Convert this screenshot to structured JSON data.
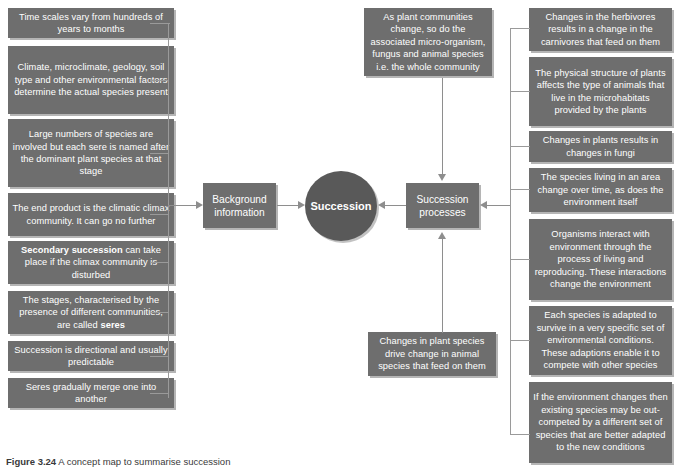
{
  "figure": {
    "caption_number": "Figure 3.24",
    "caption_text": "A concept map to summarise succession"
  },
  "core": {
    "label": "Succession"
  },
  "hubs": {
    "background": "Background\ninformation",
    "background_label": "Background information",
    "processes": "Succession\nprocesses",
    "processes_label": "Succession processes"
  },
  "left_branch": {
    "title": "Background information",
    "items": [
      {
        "id": "time-scales",
        "text": "Time scales vary from hundreds of years to months"
      },
      {
        "id": "climate-factors",
        "text": "Climate, microclimate, geology, soil type and other environmental factors determine the actual species present"
      },
      {
        "id": "large-numbers",
        "text": "Large numbers of species are involved but each sere is named after the dominant plant species at that stage"
      },
      {
        "id": "end-product",
        "text": "The end product is the climatic climax community. It can go no further"
      },
      {
        "id": "secondary-succession",
        "text": "Secondary succession can take place if the climax community is disturbed",
        "bold_prefix": "Secondary succession"
      },
      {
        "id": "stages-seres",
        "text": "The stages, characterised by the presence of different communities, are called seres",
        "bold_suffix": "seres"
      },
      {
        "id": "directional",
        "text": "Succession is directional and usually predictable"
      },
      {
        "id": "seres-merge",
        "text": "Seres gradually merge one into another"
      }
    ]
  },
  "top_branch": {
    "items": [
      {
        "id": "whole-community",
        "text": "As plant communities change, so do the associated micro-organism, fungus and animal species i.e. the whole community"
      }
    ]
  },
  "bottom_branch": {
    "items": [
      {
        "id": "plant-to-animal",
        "text": "Changes in plant species drive change in animal species that feed on them"
      }
    ]
  },
  "right_branch": {
    "title": "Succession processes",
    "items": [
      {
        "id": "herbivores-carnivores",
        "text": "Changes in the herbivores results in a change in the carnivores that feed on them"
      },
      {
        "id": "physical-structure",
        "text": "The physical structure of plants affects the type of animals that live in the microhabitats provided by the plants"
      },
      {
        "id": "plants-fungi",
        "text": "Changes in plants results in changes in fungi"
      },
      {
        "id": "species-change-time",
        "text": "The species living in an area change over time, as does the environment itself"
      },
      {
        "id": "organisms-interact",
        "text": "Organisms interact with environment through the process of living and reproducing. These interactions change the environment"
      },
      {
        "id": "adapted-species",
        "text": "Each species is adapted to survive in a very specific set of environmental conditions. These adaptions enable it to compete with other species"
      },
      {
        "id": "out-competed",
        "text": "If the environment changes then existing species may be out-competed by a different set of species that are better adapted to the new conditions"
      }
    ]
  },
  "colors": {
    "node_fill": "#6e6e6e",
    "core_fill": "#595959",
    "node_text": "#ffffff",
    "connector": "#9a9a9a",
    "arrow": "#8e8e8e",
    "background": "#ffffff"
  }
}
